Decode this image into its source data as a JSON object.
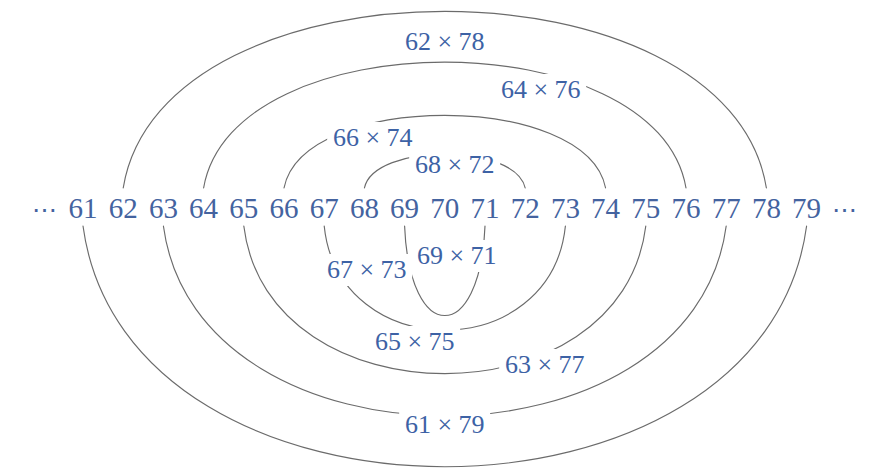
{
  "figure": {
    "accent_text_color": "#3d62a5",
    "arc_stroke_color": "#6b6b6b",
    "background_color": "#ffffff"
  },
  "numberline": {
    "left_ellipsis": "⋯",
    "right_ellipsis": "⋯",
    "numbers": [
      "61",
      "62",
      "63",
      "64",
      "65",
      "66",
      "67",
      "68",
      "69",
      "70",
      "71",
      "72",
      "73",
      "74",
      "75",
      "76",
      "77",
      "78",
      "79"
    ]
  },
  "arcs": [
    {
      "label": "62 × 78",
      "side": "top",
      "left": 62,
      "right": 78
    },
    {
      "label": "64 × 76",
      "side": "top",
      "left": 64,
      "right": 76
    },
    {
      "label": "66 × 74",
      "side": "top",
      "left": 66,
      "right": 74
    },
    {
      "label": "68 × 72",
      "side": "top",
      "left": 68,
      "right": 72
    },
    {
      "label": "69 × 71",
      "side": "bottom",
      "left": 69,
      "right": 71
    },
    {
      "label": "67 × 73",
      "side": "bottom",
      "left": 67,
      "right": 73
    },
    {
      "label": "65 × 75",
      "side": "bottom",
      "left": 65,
      "right": 75
    },
    {
      "label": "63 × 77",
      "side": "bottom",
      "left": 63,
      "right": 77
    },
    {
      "label": "61 × 79",
      "side": "bottom",
      "left": 61,
      "right": 79
    }
  ],
  "chart_data": {
    "type": "diagram",
    "center": 70,
    "pair_sum": 140,
    "x_values": [
      61,
      62,
      63,
      64,
      65,
      66,
      67,
      68,
      69,
      70,
      71,
      72,
      73,
      74,
      75,
      76,
      77,
      78,
      79
    ],
    "pairs": [
      {
        "label": "62 × 78",
        "a": 62,
        "b": 78,
        "position": "above"
      },
      {
        "label": "64 × 76",
        "a": 64,
        "b": 76,
        "position": "above"
      },
      {
        "label": "66 × 74",
        "a": 66,
        "b": 74,
        "position": "above"
      },
      {
        "label": "68 × 72",
        "a": 68,
        "b": 72,
        "position": "above"
      },
      {
        "label": "69 × 71",
        "a": 69,
        "b": 71,
        "position": "below"
      },
      {
        "label": "67 × 73",
        "a": 67,
        "b": 73,
        "position": "below"
      },
      {
        "label": "65 × 75",
        "a": 65,
        "b": 75,
        "position": "below"
      },
      {
        "label": "63 × 77",
        "a": 63,
        "b": 77,
        "position": "below"
      },
      {
        "label": "61 × 79",
        "a": 61,
        "b": 79,
        "position": "below"
      }
    ],
    "xlabel": "",
    "ylabel": "",
    "grid": false,
    "legend": "none"
  }
}
